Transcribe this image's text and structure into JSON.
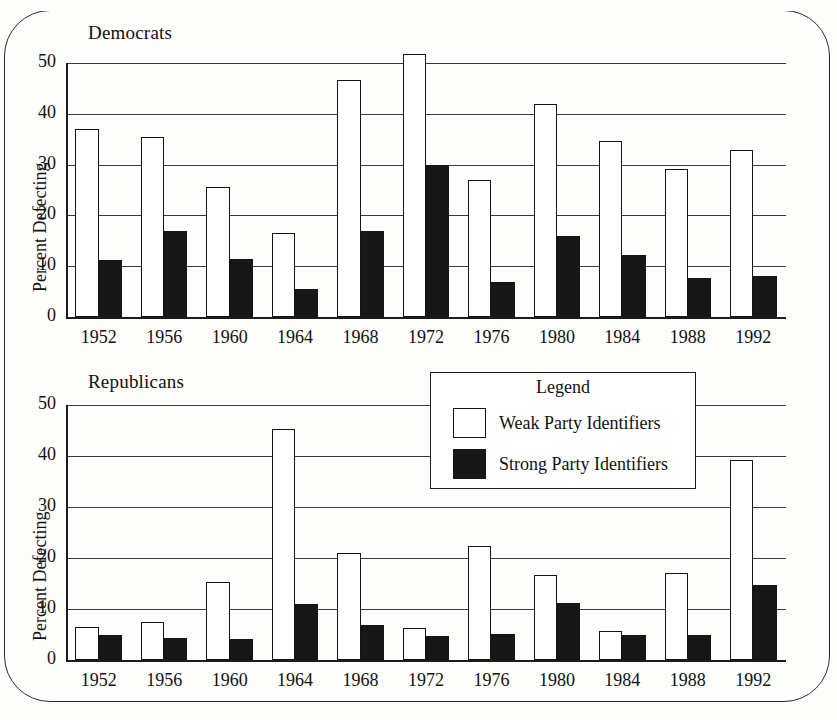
{
  "chart_data": [
    {
      "type": "bar",
      "title": "Democrats",
      "xlabel": "",
      "ylabel": "Percent Defecting",
      "ylim": [
        0,
        50
      ],
      "yticks": [
        0,
        10,
        20,
        30,
        40,
        50
      ],
      "grid": true,
      "legend_position": "none",
      "categories": [
        "1952",
        "1956",
        "1960",
        "1964",
        "1968",
        "1972",
        "1976",
        "1980",
        "1984",
        "1988",
        "1992"
      ],
      "series": [
        {
          "name": "Weak Party Identifiers",
          "values": [
            37.0,
            35.4,
            25.5,
            16.5,
            46.6,
            51.8,
            26.9,
            41.9,
            34.7,
            29.2,
            32.8
          ]
        },
        {
          "name": "Strong Party Identifiers",
          "values": [
            11.3,
            16.9,
            11.4,
            5.6,
            16.9,
            29.9,
            6.9,
            16.0,
            12.2,
            7.7,
            8.1
          ]
        }
      ]
    },
    {
      "type": "bar",
      "title": "Republicans",
      "xlabel": "",
      "ylabel": "Percent Defecting",
      "ylim": [
        0,
        50
      ],
      "yticks": [
        0,
        10,
        20,
        30,
        40,
        50
      ],
      "grid": true,
      "legend_position": "top-right",
      "categories": [
        "1952",
        "1956",
        "1960",
        "1964",
        "1968",
        "1972",
        "1976",
        "1980",
        "1984",
        "1988",
        "1992"
      ],
      "series": [
        {
          "name": "Weak Party Identifiers",
          "values": [
            6.5,
            7.4,
            15.2,
            45.2,
            20.9,
            6.3,
            22.3,
            16.7,
            5.7,
            17.1,
            39.2
          ]
        },
        {
          "name": "Strong Party Identifiers",
          "values": [
            5.0,
            4.3,
            4.1,
            10.9,
            6.9,
            4.8,
            5.1,
            11.1,
            4.9,
            4.9,
            14.7
          ]
        }
      ]
    }
  ],
  "top_chart": {
    "title": "Democrats",
    "ylabel": "Percent Defecting",
    "yticks": [
      "50",
      "40",
      "30",
      "20",
      "10",
      "0"
    ],
    "xticks": [
      "1952",
      "1956",
      "1960",
      "1964",
      "1968",
      "1972",
      "1976",
      "1980",
      "1984",
      "1988",
      "1992"
    ]
  },
  "bottom_chart": {
    "title": "Republicans",
    "ylabel": "Percent Defecting",
    "yticks": [
      "50",
      "40",
      "30",
      "20",
      "10",
      "0"
    ],
    "xticks": [
      "1952",
      "1956",
      "1960",
      "1964",
      "1968",
      "1972",
      "1976",
      "1980",
      "1984",
      "1988",
      "1992"
    ]
  },
  "legend": {
    "title": "Legend",
    "items": [
      {
        "label": "Weak Party Identifiers",
        "swatch": "white-square-icon",
        "color": "#ffffff"
      },
      {
        "label": "Strong Party Identifiers",
        "swatch": "black-square-icon",
        "color": "#171717"
      }
    ]
  },
  "colors": {
    "weak_fill": "#ffffff",
    "strong_fill": "#171717",
    "outline": "#141414",
    "grid": "#3a3a3a",
    "page_background": "#fdfdfb"
  }
}
